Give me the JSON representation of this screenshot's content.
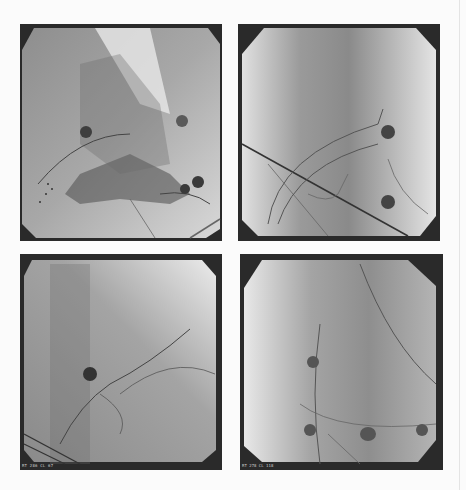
{
  "figure": {
    "layout": "2x2 grid",
    "background": "#fbfbfb",
    "panels": [
      {
        "id": "top-left",
        "view": "fluoroscopy, lateral",
        "label": "",
        "electrodes": 4
      },
      {
        "id": "top-right",
        "view": "fluoroscopy, frontal",
        "label": "",
        "electrodes": 2
      },
      {
        "id": "bottom-left",
        "view": "fluoroscopy, oblique",
        "label": "RT 286 CL 67",
        "electrodes": 1
      },
      {
        "id": "bottom-right",
        "view": "fluoroscopy, frontal",
        "label": "RT 278 CL 118",
        "electrodes": 4
      }
    ]
  }
}
